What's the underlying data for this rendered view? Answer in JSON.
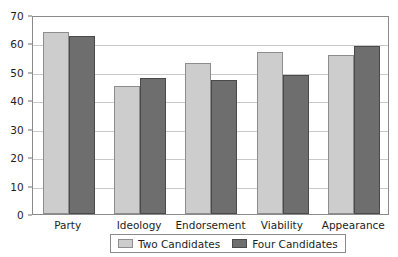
{
  "chart_data": {
    "type": "bar",
    "title": "",
    "xlabel": "",
    "ylabel": "",
    "ylim": [
      0,
      70
    ],
    "yticks": [
      0,
      10,
      20,
      30,
      40,
      50,
      60,
      70
    ],
    "grid": true,
    "legend_position": "bottom",
    "categories": [
      "Party",
      "Ideology",
      "Endorsement",
      "Viability",
      "Appearance"
    ],
    "series": [
      {
        "name": "Two Candidates",
        "color": "#cdcdcd",
        "values": [
          64,
          45,
          53,
          57,
          56
        ]
      },
      {
        "name": "Four Candidates",
        "color": "#6e6e6e",
        "values": [
          62.5,
          48,
          47,
          49,
          59
        ]
      }
    ]
  },
  "axis": {
    "y_tick_labels": [
      "0",
      "10",
      "20",
      "30",
      "40",
      "50",
      "60",
      "70"
    ],
    "x_tick_labels": [
      "Party",
      "Ideology",
      "Endorsement",
      "Viability",
      "Appearance"
    ]
  },
  "legend": {
    "entries": [
      {
        "label": "Two Candidates",
        "swatch": "light-gray-swatch"
      },
      {
        "label": "Four Candidates",
        "swatch": "dark-gray-swatch"
      }
    ]
  },
  "colors": {
    "series_two": "#cdcdcd",
    "series_four": "#6e6e6e",
    "gridline": "#c9c9c9",
    "frame": "#8a8a8a",
    "text": "#1d1d1d",
    "background": "#ffffff"
  }
}
